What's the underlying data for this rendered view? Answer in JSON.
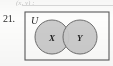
{
  "exercise": {
    "number": "21.",
    "clipped_line_above": "(x, y) :"
  },
  "figure": {
    "type": "venn-diagram",
    "universe_label": "U",
    "sets": [
      {
        "label": "X",
        "cx": 28,
        "cy": 26,
        "r": 17
      },
      {
        "label": "Y",
        "cx": 56,
        "cy": 26,
        "r": 17
      }
    ],
    "overlap": true,
    "colors": {
      "circle_fill": "#c9c9c9",
      "circle_stroke": "#6e6e6e",
      "box_stroke": "#5a5a5a",
      "label_color": "#1f1f1f",
      "paper": "#fdfdfc"
    }
  },
  "chart_data": {
    "type": "diagram",
    "universe": "U",
    "sets": [
      "X",
      "Y"
    ],
    "regions": [
      "X only",
      "X and Y",
      "Y only",
      "outside X and Y"
    ],
    "shaded": [
      "X only",
      "X and Y",
      "Y only"
    ],
    "legend": []
  }
}
